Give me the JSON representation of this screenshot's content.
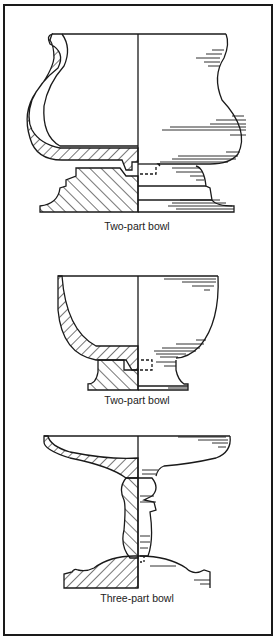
{
  "figure": {
    "colors": {
      "ink": "#1a1a1a",
      "paper": "#ffffff"
    },
    "panels": [
      {
        "id": "bowl-1",
        "caption": "Two-part bowl"
      },
      {
        "id": "bowl-2",
        "caption": "Two-part bowl"
      },
      {
        "id": "bowl-3",
        "caption": "Three-part bowl"
      }
    ]
  }
}
